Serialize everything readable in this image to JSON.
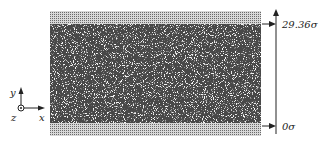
{
  "figure": {
    "colors": {
      "fluid": "#4a4a4a",
      "wall": "#9a9a9a",
      "background": "#ffffff",
      "ink": "#222222"
    }
  },
  "height_axis": {
    "top_label": "29.36σ",
    "bottom_label": "0σ"
  },
  "axes_indicator": {
    "y_label": "y",
    "z_label": "z",
    "x_label": "x"
  }
}
